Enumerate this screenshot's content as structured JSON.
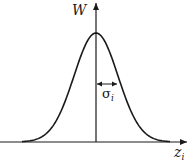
{
  "figure": {
    "type": "gaussian-distribution-diagram",
    "y_axis_label": "W",
    "x_axis_label": {
      "base": "z",
      "subscript": "i"
    },
    "width_marker": {
      "symbol": "σ",
      "subscript": "i"
    },
    "colors": {
      "line": "#1a1a1a",
      "background": "#ffffff"
    }
  },
  "curve": {
    "shape": "gaussian",
    "center_px": 96,
    "baseline_px": 142,
    "peak_px": 33,
    "sigma_px": 22
  }
}
